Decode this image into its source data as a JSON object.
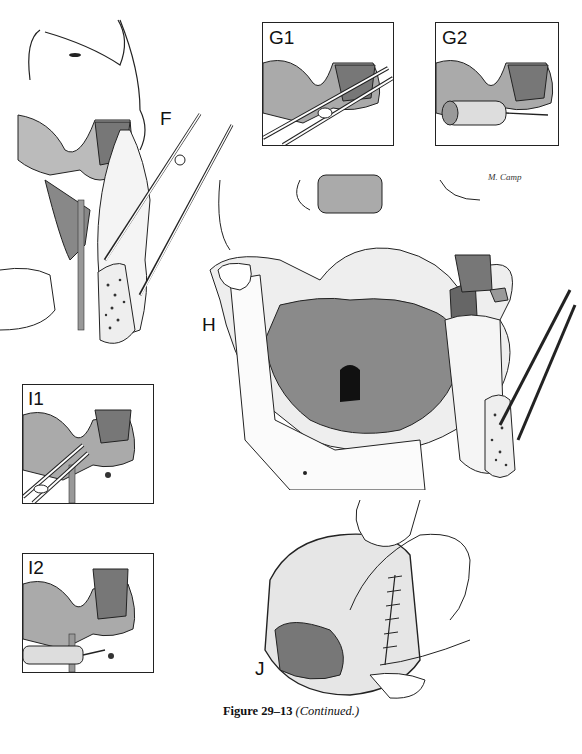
{
  "figure": {
    "caption_bold": "Figure 29–13",
    "caption_italic": "(Continued.)",
    "artist_signature": "M. Camp"
  },
  "panels": {
    "F": {
      "label": "F",
      "description": "Lateral view of skull base with mandibular ramus retracted by forceps; cross-section of bone shown"
    },
    "G1": {
      "label": "G1",
      "description": "Inset: forceps grasping structure beneath zygomatic arch"
    },
    "G2": {
      "label": "G2",
      "description": "Inset: drill/bur applied beneath zygomatic arch"
    },
    "H": {
      "label": "H",
      "description": "Frontal view of skull with mandible split and retracted, exposing nasopharynx and skull base"
    },
    "I1": {
      "label": "I1",
      "description": "Inset: scissors dividing tissue below zygomatic arch"
    },
    "I2": {
      "label": "I2",
      "description": "Inset: drill applied to bone below zygomatic arch"
    },
    "J": {
      "label": "J",
      "description": "Intraoral view of sutured incision with tongue and retracted lip"
    }
  },
  "colors": {
    "ink": "#111111",
    "hatch": "#555555",
    "paper": "#ffffff",
    "shade": "#8a8a8a"
  }
}
